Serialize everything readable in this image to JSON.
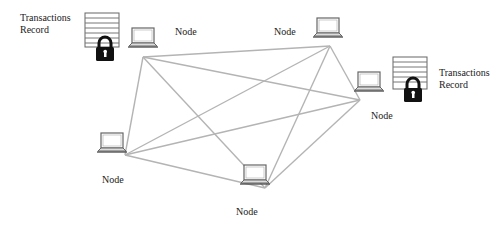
{
  "diagram": {
    "type": "network",
    "edge_color": "#b4b4b4",
    "nodes": [
      {
        "id": "n1",
        "label": "Node",
        "x": 143,
        "y": 57
      },
      {
        "id": "n2",
        "label": "Node",
        "x": 330,
        "y": 46
      },
      {
        "id": "n3",
        "label": "Node",
        "x": 360,
        "y": 100
      },
      {
        "id": "n4",
        "label": "Node",
        "x": 125,
        "y": 155
      },
      {
        "id": "n5",
        "label": "Node",
        "x": 265,
        "y": 188
      }
    ],
    "edges": [
      [
        "n1",
        "n2"
      ],
      [
        "n1",
        "n3"
      ],
      [
        "n1",
        "n4"
      ],
      [
        "n1",
        "n5"
      ],
      [
        "n2",
        "n3"
      ],
      [
        "n2",
        "n4"
      ],
      [
        "n2",
        "n5"
      ],
      [
        "n3",
        "n4"
      ],
      [
        "n3",
        "n5"
      ],
      [
        "n4",
        "n5"
      ]
    ],
    "records": [
      {
        "id": "record-left",
        "line1": "Transactions",
        "line2": "Record"
      },
      {
        "id": "record-right",
        "line1": "Transactions",
        "line2": "Record"
      }
    ]
  }
}
